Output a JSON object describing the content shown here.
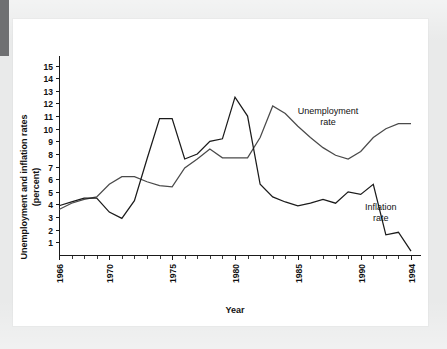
{
  "page": {
    "background_color": "#e9eaea",
    "card_color": "#ffffff",
    "left_tab_color": "#6f7072"
  },
  "chart_data": {
    "type": "line",
    "title": "",
    "xlabel": "Year",
    "ylabel": "Unemployment and inflation rates (percent)",
    "ylabel_line1": "Unemployment and inflation rates",
    "ylabel_line2": "(percent)",
    "xlim": [
      1966,
      1994
    ],
    "ylim": [
      0,
      15.6
    ],
    "grid": false,
    "legend_position": "inline-annotations",
    "y_ticks": [
      1,
      2,
      3,
      4,
      5,
      6,
      7,
      8,
      9,
      10,
      11,
      12,
      13,
      14,
      15
    ],
    "y_tick_labels": [
      "1",
      "2",
      "3",
      "4",
      "5",
      "6",
      "7",
      "8",
      "9",
      "10",
      "11",
      "12",
      "13",
      "14",
      "15"
    ],
    "x_ticks": [
      1966,
      1967,
      1968,
      1969,
      1970,
      1971,
      1972,
      1973,
      1974,
      1975,
      1976,
      1977,
      1978,
      1979,
      1980,
      1981,
      1982,
      1983,
      1984,
      1985,
      1986,
      1987,
      1988,
      1989,
      1990,
      1991,
      1992,
      1993,
      1994
    ],
    "x_tick_labels_shown": [
      "1966",
      "1970",
      "1975",
      "1980",
      "1985",
      "1990",
      "1994"
    ],
    "x_tick_label_years": [
      1966,
      1970,
      1975,
      1980,
      1985,
      1990,
      1994
    ],
    "x": [
      1966,
      1967,
      1968,
      1969,
      1970,
      1971,
      1972,
      1973,
      1974,
      1975,
      1976,
      1977,
      1978,
      1979,
      1980,
      1981,
      1982,
      1983,
      1984,
      1985,
      1986,
      1987,
      1988,
      1989,
      1990,
      1991,
      1992,
      1993,
      1994
    ],
    "series": [
      {
        "name": "Inflation rate",
        "color": "#1b1b1b",
        "annotation": "Inflation\nrate",
        "values": [
          3.9,
          4.2,
          4.5,
          4.5,
          3.4,
          2.9,
          4.3,
          7.6,
          10.8,
          10.8,
          7.6,
          8.0,
          9.0,
          9.2,
          12.5,
          11.0,
          5.6,
          4.6,
          4.2,
          3.9,
          4.1,
          4.4,
          4.1,
          5.0,
          4.8,
          5.6,
          1.6,
          1.8,
          0.3
        ]
      },
      {
        "name": "Unemployment rate",
        "color": "#4a4a4a",
        "annotation": "Unemployment\nrate",
        "values": [
          3.6,
          4.1,
          4.4,
          4.6,
          5.6,
          6.2,
          6.2,
          5.8,
          5.5,
          5.4,
          6.9,
          7.6,
          8.4,
          7.7,
          7.7,
          7.7,
          9.3,
          11.8,
          11.2,
          10.2,
          9.3,
          8.5,
          7.9,
          7.6,
          8.2,
          9.3,
          10.0,
          10.4,
          10.4
        ]
      }
    ],
    "annotations": [
      {
        "text_line1": "Unemployment",
        "text_line2": "rate",
        "x": 1987.4,
        "y": 11.2
      },
      {
        "text_line1": "Inflation",
        "text_line2": "rate",
        "x": 1991.6,
        "y": 3.6
      }
    ]
  }
}
